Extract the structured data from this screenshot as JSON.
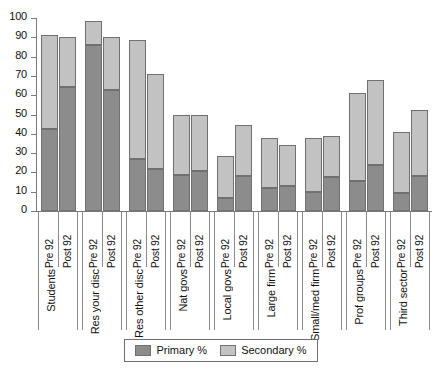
{
  "chart_data": {
    "type": "bar",
    "title": "",
    "subtitle": "",
    "xlabel": "",
    "ylabel": "",
    "ylim": [
      0,
      100
    ],
    "yticks": [
      0,
      10,
      20,
      30,
      40,
      50,
      60,
      70,
      80,
      90,
      100
    ],
    "grid": false,
    "stacked": true,
    "legend_position": "bottom",
    "legend": [
      "Primary %",
      "Secondary %"
    ],
    "series_names": [
      "Pre 92",
      "Post 92"
    ],
    "categories": [
      "Students",
      "Res your disc",
      "Res other disc",
      "Nat govs",
      "Local govs",
      "Large firm",
      "Small/med firm",
      "Prof groups",
      "Third sector"
    ],
    "series": [
      {
        "name": "Primary %",
        "color": "#8c8c8c",
        "groups": [
          {
            "category": "Students",
            "Pre 92": 42.5,
            "Post 92": 64.0
          },
          {
            "category": "Res your disc",
            "Pre 92": 86.0,
            "Post 92": 62.5
          },
          {
            "category": "Res other disc",
            "Pre 92": 27.0,
            "Post 92": 22.0
          },
          {
            "category": "Nat govs",
            "Pre 92": 18.5,
            "Post 92": 20.5
          },
          {
            "category": "Local govs",
            "Pre 92": 7.0,
            "Post 92": 18.0
          },
          {
            "category": "Large firm",
            "Pre 92": 12.0,
            "Post 92": 13.0
          },
          {
            "category": "Small/med firm",
            "Pre 92": 10.0,
            "Post 92": 17.5
          },
          {
            "category": "Prof groups",
            "Pre 92": 15.5,
            "Post 92": 24.0
          },
          {
            "category": "Third sector",
            "Pre 92": 9.5,
            "Post 92": 18.0
          }
        ]
      },
      {
        "name": "Secondary %",
        "color": "#c2c2c2",
        "groups": [
          {
            "category": "Students",
            "Pre 92": 48.5,
            "Post 92": 26.0
          },
          {
            "category": "Res your disc",
            "Pre 92": 12.5,
            "Post 92": 27.5
          },
          {
            "category": "Res other disc",
            "Pre 92": 61.5,
            "Post 92": 49.0
          },
          {
            "category": "Nat govs",
            "Pre 92": 31.5,
            "Post 92": 29.0
          },
          {
            "category": "Local govs",
            "Pre 92": 21.5,
            "Post 92": 26.5
          },
          {
            "category": "Large firm",
            "Pre 92": 26.0,
            "Post 92": 21.0
          },
          {
            "category": "Small/med firm",
            "Pre 92": 28.0,
            "Post 92": 21.5
          },
          {
            "category": "Prof groups",
            "Pre 92": 45.5,
            "Post 92": 44.0
          },
          {
            "category": "Third sector",
            "Pre 92": 31.5,
            "Post 92": 34.5
          }
        ]
      }
    ],
    "totals": [
      {
        "category": "Students",
        "Pre 92": 91.0,
        "Post 92": 90.0
      },
      {
        "category": "Res your disc",
        "Pre 92": 98.5,
        "Post 92": 90.0
      },
      {
        "category": "Res other disc",
        "Pre 92": 88.5,
        "Post 92": 71.0
      },
      {
        "category": "Nat govs",
        "Pre 92": 50.0,
        "Post 92": 49.5
      },
      {
        "category": "Local govs",
        "Pre 92": 28.5,
        "Post 92": 44.5
      },
      {
        "category": "Large firm",
        "Pre 92": 38.0,
        "Post 92": 34.0
      },
      {
        "category": "Small/med firm",
        "Pre 92": 38.0,
        "Post 92": 39.0
      },
      {
        "category": "Prof groups",
        "Pre 92": 61.0,
        "Post 92": 68.0
      },
      {
        "category": "Third sector",
        "Pre 92": 41.0,
        "Post 92": 52.5
      }
    ]
  },
  "colors": {
    "primary": "#8c8c8c",
    "secondary": "#c2c2c2",
    "axis": "#7a7a7a",
    "outline": "#707070",
    "background": "#ffffff"
  }
}
